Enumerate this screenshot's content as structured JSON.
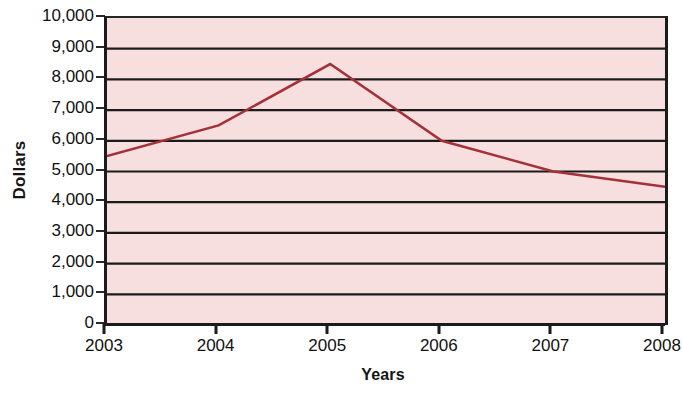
{
  "chart_data": {
    "type": "line",
    "title": "",
    "xlabel": "Years",
    "ylabel": "Dollars",
    "categories": [
      "2003",
      "2004",
      "2005",
      "2006",
      "2007",
      "2008"
    ],
    "values": [
      5500,
      6500,
      8500,
      6000,
      5000,
      4500
    ],
    "series": [
      {
        "name": "Dollars",
        "values": [
          5500,
          6500,
          8500,
          6000,
          5000,
          4500
        ],
        "color": "#a33138"
      }
    ],
    "ylim": [
      0,
      10000
    ],
    "ytick_step": 1000,
    "ytick_labels": [
      "10,000",
      "9,000",
      "8,000",
      "7,000",
      "6,000",
      "5,000",
      "4,000",
      "3,000",
      "2,000",
      "1,000",
      "0"
    ],
    "ytick_values": [
      10000,
      9000,
      8000,
      7000,
      6000,
      5000,
      4000,
      3000,
      2000,
      1000,
      0
    ],
    "xtick_labels": [
      "2003",
      "2004",
      "2005",
      "2006",
      "2007",
      "2008"
    ],
    "grid": true,
    "grid_axis": "y",
    "grid_color": "#1b1b1b",
    "legend": false,
    "legend_position": "none",
    "plot_background": "#f7dedf",
    "line_color": "#a33138",
    "line_width": 2.5,
    "markers": false
  }
}
